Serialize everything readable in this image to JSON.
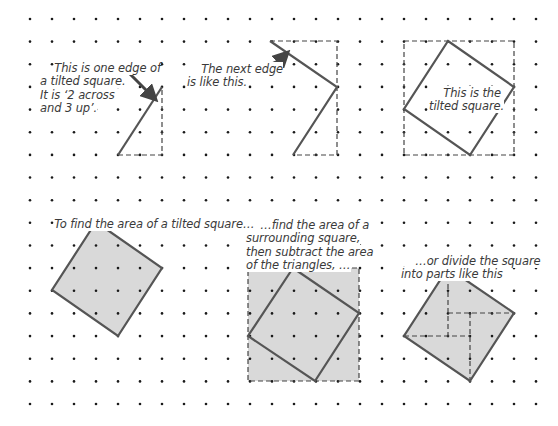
{
  "grid": {
    "origin_x": 30,
    "origin_y": 19,
    "step_x": 22.0,
    "step_y": 22.65,
    "cols": 24,
    "rows": 18,
    "dot_color": "#1a1a1a"
  },
  "colors": {
    "outline": "#555555",
    "fill": "#d9d9d9",
    "dashed": "#444444",
    "text": "#3a3a3a",
    "arrow": "#444444"
  },
  "notes": {
    "one_edge": "This is one edge of\na tilted square.\nIt is ‘2 across\nand 3 up’.",
    "next_edge": "The next edge\nis like this.",
    "tilted_square": "This is the\ntilted square.",
    "find_area": "To find the area of a tilted square…",
    "surrounding": "…find the area of a\nsurrounding square,\nthen subtract the area\nof the triangles, …",
    "divide": "…or divide the square\ninto parts like this"
  },
  "figures": {
    "edge_one": {
      "solid": [
        [
          118,
          155
        ],
        [
          162,
          87
        ]
      ],
      "dashed": [
        [
          118,
          155
        ],
        [
          162,
          155
        ],
        [
          162,
          87
        ]
      ],
      "arrow": {
        "from": [
          130,
          74
        ],
        "to": [
          152,
          96
        ]
      }
    },
    "edge_two": {
      "solid": [
        [
          270,
          41
        ],
        [
          337,
          87
        ],
        [
          293,
          155
        ]
      ],
      "dashed": [
        [
          270,
          41
        ],
        [
          337,
          41
        ],
        [
          337,
          155
        ],
        [
          293,
          155
        ]
      ],
      "arrow": {
        "from": [
          244,
          66
        ],
        "to": [
          284,
          56
        ]
      }
    },
    "tilted_square": {
      "frame": [
        [
          404,
          41
        ],
        [
          514,
          41
        ],
        [
          514,
          155
        ],
        [
          404,
          155
        ]
      ],
      "square": [
        [
          448,
          41
        ],
        [
          514,
          87
        ],
        [
          470,
          155
        ],
        [
          404,
          109
        ]
      ]
    },
    "area_square": {
      "square": [
        [
          96,
          222
        ],
        [
          162,
          268
        ],
        [
          118,
          336
        ],
        [
          52,
          290
        ]
      ]
    },
    "surround_square": {
      "frame": [
        [
          248,
          268
        ],
        [
          359,
          268
        ],
        [
          359,
          381
        ],
        [
          248,
          381
        ]
      ],
      "square": [
        [
          293,
          268
        ],
        [
          359,
          313
        ],
        [
          315,
          381
        ],
        [
          248,
          336
        ]
      ]
    },
    "divided_square": {
      "square": [
        [
          448,
          268
        ],
        [
          514,
          313
        ],
        [
          470,
          381
        ],
        [
          404,
          336
        ]
      ],
      "cuts": [
        [
          [
            448,
            268
          ],
          [
            448,
            336
          ]
        ],
        [
          [
            448,
            313
          ],
          [
            514,
            313
          ]
        ],
        [
          [
            470,
            313
          ],
          [
            470,
            381
          ]
        ],
        [
          [
            404,
            336
          ],
          [
            470,
            336
          ]
        ]
      ]
    }
  }
}
